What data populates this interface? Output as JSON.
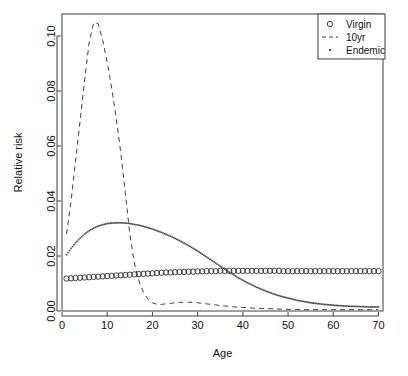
{
  "chart_data": {
    "type": "line",
    "title": "",
    "xlabel": "Age",
    "ylabel": "Relative risk",
    "xlim": [
      0,
      71
    ],
    "ylim": [
      0.0,
      0.108
    ],
    "xticks": [
      0,
      10,
      20,
      30,
      40,
      50,
      60,
      70
    ],
    "yticks": [
      0.0,
      0.02,
      0.04,
      0.06,
      0.08,
      0.1
    ],
    "xtick_labels": [
      "0",
      "10",
      "20",
      "30",
      "40",
      "50",
      "60",
      "70"
    ],
    "ytick_labels": [
      "0.00",
      "0.02",
      "0.04",
      "0.06",
      "0.08",
      "0.10"
    ],
    "grid": false,
    "legend_position": "top-right",
    "x": [
      1,
      2,
      3,
      4,
      5,
      6,
      7,
      8,
      9,
      10,
      11,
      12,
      13,
      14,
      15,
      16,
      17,
      18,
      19,
      20,
      21,
      22,
      23,
      24,
      25,
      26,
      27,
      28,
      29,
      30,
      31,
      32,
      33,
      34,
      35,
      36,
      37,
      38,
      39,
      40,
      41,
      42,
      43,
      44,
      45,
      46,
      47,
      48,
      49,
      50,
      51,
      52,
      53,
      54,
      55,
      56,
      57,
      58,
      59,
      60,
      61,
      62,
      63,
      64,
      65,
      66,
      67,
      68,
      69,
      70
    ],
    "series": [
      {
        "name": "Virgin",
        "marker": "circle",
        "linestyle": "none",
        "color": "#2b2b2b",
        "values": [
          0.0118,
          0.0119,
          0.012,
          0.0121,
          0.0122,
          0.0123,
          0.0124,
          0.0125,
          0.0126,
          0.0127,
          0.0128,
          0.0129,
          0.013,
          0.0131,
          0.0132,
          0.0133,
          0.0134,
          0.0135,
          0.0136,
          0.0137,
          0.0138,
          0.0139,
          0.014,
          0.014,
          0.0141,
          0.0142,
          0.0142,
          0.0143,
          0.0143,
          0.0144,
          0.0144,
          0.0145,
          0.0145,
          0.0145,
          0.0146,
          0.0146,
          0.0146,
          0.0146,
          0.0146,
          0.0146,
          0.0146,
          0.0146,
          0.0146,
          0.0146,
          0.0146,
          0.0146,
          0.0146,
          0.0146,
          0.0145,
          0.0145,
          0.0145,
          0.0145,
          0.0145,
          0.0145,
          0.0145,
          0.0145,
          0.0145,
          0.0145,
          0.0145,
          0.0145,
          0.0145,
          0.0145,
          0.0145,
          0.0145,
          0.0145,
          0.0145,
          0.0145,
          0.0145,
          0.0145,
          0.0145
        ]
      },
      {
        "name": "10yr",
        "marker": "none",
        "linestyle": "dashed",
        "color": "#3f3f3f",
        "values": [
          0.028,
          0.04,
          0.0545,
          0.069,
          0.084,
          0.0975,
          0.1048,
          0.1045,
          0.0985,
          0.0905,
          0.081,
          0.07,
          0.0575,
          0.043,
          0.028,
          0.0175,
          0.011,
          0.0068,
          0.0043,
          0.003,
          0.0024,
          0.0024,
          0.0026,
          0.0028,
          0.003,
          0.0031,
          0.0032,
          0.0032,
          0.0031,
          0.003,
          0.0028,
          0.0026,
          0.0024,
          0.0022,
          0.002,
          0.0018,
          0.0017,
          0.0015,
          0.0014,
          0.0013,
          0.0012,
          0.0011,
          0.001,
          0.0009,
          0.0009,
          0.0008,
          0.0008,
          0.0007,
          0.0007,
          0.0006,
          0.0006,
          0.0006,
          0.0005,
          0.0005,
          0.0005,
          0.0005,
          0.0005,
          0.0005,
          0.0005,
          0.0005,
          0.0005,
          0.0005,
          0.0005,
          0.0005,
          0.0005,
          0.0005,
          0.0005,
          0.0005,
          0.0005,
          0.0005
        ]
      },
      {
        "name": "Endemic",
        "marker": "dot",
        "linestyle": "dotted",
        "color": "#4a4a4a",
        "values": [
          0.0205,
          0.0228,
          0.0248,
          0.0265,
          0.028,
          0.0292,
          0.0302,
          0.0309,
          0.0314,
          0.0318,
          0.032,
          0.0321,
          0.0321,
          0.032,
          0.0318,
          0.0315,
          0.0312,
          0.0308,
          0.0303,
          0.0298,
          0.0292,
          0.0286,
          0.0279,
          0.0272,
          0.0264,
          0.0256,
          0.0247,
          0.0238,
          0.0228,
          0.0218,
          0.0207,
          0.0196,
          0.0185,
          0.0174,
          0.0163,
          0.0152,
          0.0141,
          0.0131,
          0.0121,
          0.0112,
          0.0103,
          0.0095,
          0.0087,
          0.008,
          0.0073,
          0.0067,
          0.0061,
          0.0056,
          0.0051,
          0.0047,
          0.0043,
          0.0039,
          0.0036,
          0.0033,
          0.003,
          0.0028,
          0.0026,
          0.0024,
          0.0023,
          0.0021,
          0.002,
          0.0019,
          0.0018,
          0.0017,
          0.0017,
          0.0016,
          0.0016,
          0.0015,
          0.0015,
          0.0015
        ]
      }
    ],
    "legend": [
      {
        "label": "Virgin",
        "marker": "circle"
      },
      {
        "label": "10yr",
        "marker": "dashed-line"
      },
      {
        "label": "Endemic",
        "marker": "dot"
      }
    ]
  }
}
